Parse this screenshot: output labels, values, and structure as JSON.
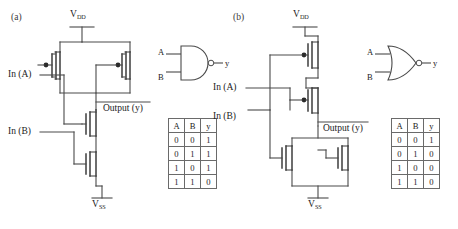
{
  "figure": {
    "background": "#ffffff",
    "line_color": "#4a4a4a"
  },
  "panels": [
    {
      "id": "nand",
      "label": "(a)",
      "gate_type": "NAND",
      "supply_top_label_main": "V",
      "supply_top_label_sub": "DD",
      "supply_bottom_label_main": "V",
      "supply_bottom_label_sub": "SS",
      "input_a_label": "In (A)",
      "input_b_label": "In (B)",
      "output_label": "Output (y)",
      "symbol": {
        "input_a": "A",
        "input_b": "B",
        "output": "y",
        "shape": "and-shape-with-bubble"
      },
      "truth_table": {
        "headers": [
          "A",
          "B",
          "y"
        ],
        "rows": [
          [
            "0",
            "0",
            "1"
          ],
          [
            "0",
            "1",
            "1"
          ],
          [
            "1",
            "0",
            "1"
          ],
          [
            "1",
            "1",
            "0"
          ]
        ]
      },
      "topology": {
        "pmos": "two-in-parallel",
        "nmos": "two-in-series"
      }
    },
    {
      "id": "nor",
      "label": "(b)",
      "gate_type": "NOR",
      "supply_top_label_main": "V",
      "supply_top_label_sub": "DD",
      "supply_bottom_label_main": "V",
      "supply_bottom_label_sub": "SS",
      "input_a_label": "In (A)",
      "input_b_label": "In (B)",
      "output_label": "Output (y)",
      "symbol": {
        "input_a": "A",
        "input_b": "B",
        "output": "y",
        "shape": "or-shape-with-bubble"
      },
      "truth_table": {
        "headers": [
          "A",
          "B",
          "y"
        ],
        "rows": [
          [
            "0",
            "0",
            "1"
          ],
          [
            "0",
            "1",
            "0"
          ],
          [
            "1",
            "0",
            "0"
          ],
          [
            "1",
            "1",
            "0"
          ]
        ]
      },
      "topology": {
        "pmos": "two-in-series",
        "nmos": "two-in-parallel"
      }
    }
  ]
}
